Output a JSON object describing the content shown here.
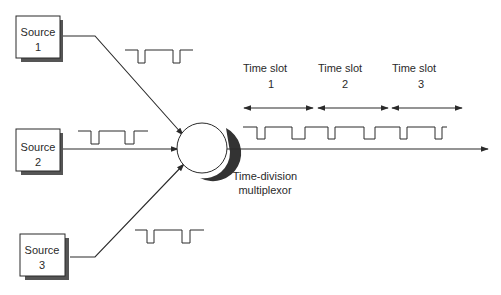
{
  "diagram": {
    "type": "time-division-multiplexing",
    "sources": [
      {
        "label_line1": "Source",
        "label_line2": "1"
      },
      {
        "label_line1": "Source",
        "label_line2": "2"
      },
      {
        "label_line1": "Source",
        "label_line2": "3"
      }
    ],
    "multiplexor": {
      "label_line1": "Time-division",
      "label_line2": "multiplexor"
    },
    "time_slots": [
      {
        "label_line1": "Time slot",
        "label_line2": "1"
      },
      {
        "label_line1": "Time slot",
        "label_line2": "2"
      },
      {
        "label_line1": "Time slot",
        "label_line2": "3"
      }
    ],
    "colors": {
      "line": "#2a2a2a",
      "shadow": "#555555",
      "box_fill": "#ffffff"
    }
  }
}
